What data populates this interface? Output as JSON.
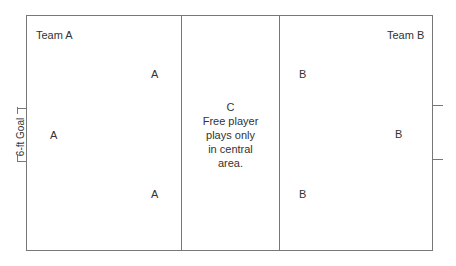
{
  "diagram": {
    "left_zone": {
      "team_label": "Team A",
      "players": [
        "A",
        "A",
        "A"
      ]
    },
    "center_zone": {
      "player": "C",
      "description_lines": [
        "Free player",
        "plays only",
        "in central",
        "area."
      ]
    },
    "right_zone": {
      "team_label": "Team B",
      "players": [
        "B",
        "B",
        "B"
      ]
    },
    "left_goal": {
      "label": "6-ft Goal"
    },
    "right_goal": {
      "label": ""
    },
    "colors": {
      "line": "#777777",
      "text": "#333333",
      "background": "#ffffff"
    }
  }
}
